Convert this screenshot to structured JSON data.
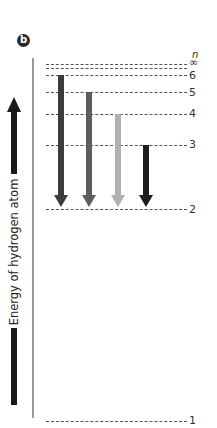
{
  "panel": {
    "label": "b"
  },
  "axis": {
    "label": "Energy of hydrogen atom",
    "direction": "up",
    "level_header": "n"
  },
  "levels": [
    {
      "n": "∞",
      "y": 64
    },
    {
      "n": "",
      "y": 68
    },
    {
      "n": "6",
      "y": 75
    },
    {
      "n": "5",
      "y": 92
    },
    {
      "n": "4",
      "y": 114
    },
    {
      "n": "3",
      "y": 145
    },
    {
      "n": "2",
      "y": 209
    },
    {
      "n": "1",
      "y": 421
    }
  ],
  "transitions": [
    {
      "from": "6",
      "to": "2",
      "color": "#3c3c3c"
    },
    {
      "from": "5",
      "to": "2",
      "color": "#5e5e5e"
    },
    {
      "from": "4",
      "to": "2",
      "color": "#b0b0b0"
    },
    {
      "from": "3",
      "to": "2",
      "color": "#1e1e1e"
    }
  ]
}
